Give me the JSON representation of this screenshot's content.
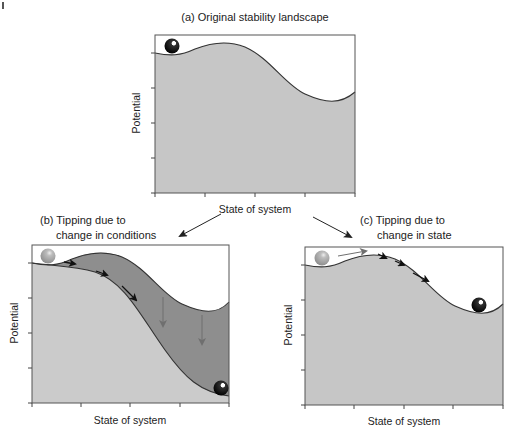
{
  "colors": {
    "landscape_fill": "#c6c6c6",
    "new_landscape_fill": "#cbcbcb",
    "shifted_band_fill": "#8e8e8e",
    "curve_stroke": "#333333",
    "ball_dark": "#0d0d0d",
    "ball_light": "#9a9a9a",
    "arrow_dark": "#111111",
    "arrow_gray": "#6f6f6f"
  },
  "panel_a": {
    "title": "(a) Original stability landscape",
    "ylabel": "Potential",
    "xlabel": "State of system"
  },
  "panel_b": {
    "title_line1": "(b) Tipping due to",
    "title_line2": "change in conditions",
    "ylabel": "Potential",
    "xlabel": "State of system"
  },
  "panel_c": {
    "title_line1": "(c) Tipping due to",
    "title_line2": "change in state",
    "ylabel": "Potential",
    "xlabel": "State of system"
  }
}
